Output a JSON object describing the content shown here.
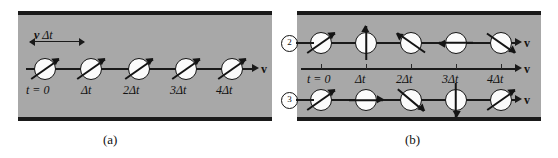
{
  "figure": {
    "panels": [
      {
        "id": "a",
        "caption": "(a)",
        "dimension_label": "v Δt",
        "velocity_label": "v",
        "time_labels": [
          "t = 0",
          "Δt",
          "2Δt",
          "3Δt",
          "4Δt"
        ],
        "spin_angles_deg": [
          -35,
          -35,
          -35,
          -35,
          -35
        ],
        "description": "uniform spin orientation along channel"
      },
      {
        "id": "b",
        "caption": "(b)",
        "velocity_label": "v",
        "time_labels": [
          "t = 0",
          "Δt",
          "2Δt",
          "3Δt",
          "4Δt"
        ],
        "rows": [
          {
            "number": "2",
            "spin_angles_deg": [
              -35,
              -90,
              -145,
              180,
              35
            ]
          },
          {
            "number": "3",
            "spin_angles_deg": [
              -35,
              0,
              40,
              90,
              -35
            ]
          }
        ]
      }
    ]
  },
  "colors": {
    "channel_fill": "#a8a8a8",
    "channel_border": "#1a1a1a",
    "particle_fill": "#fbfbfb",
    "ink": "#141414"
  }
}
